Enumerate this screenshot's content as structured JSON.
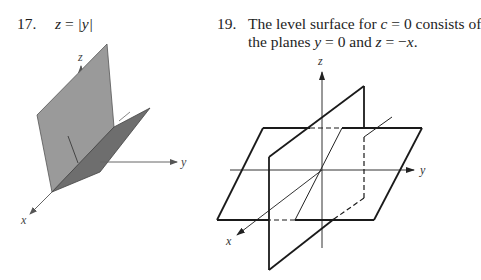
{
  "problems": [
    {
      "number": "17.",
      "equation": {
        "lhs": "z",
        "eq": " = ",
        "rhs": "|y|"
      },
      "figure": {
        "type": "3d-surface",
        "description": "V-shaped surface z = |y| shown as two shaded half-planes",
        "axes": {
          "x": "x",
          "y": "y",
          "z": "z"
        },
        "colors": {
          "left_plane": "#9a9a9a",
          "right_plane": "#6e6e6e",
          "axis": "#555555"
        }
      }
    },
    {
      "number": "19.",
      "text_line1_a": "The level surface for ",
      "text_line1_var": "c",
      "text_line1_b": " = 0 consists of",
      "text_line2_a": "the planes ",
      "text_line2_var1": "y",
      "text_line2_b": " = 0 and ",
      "text_line2_var2": "z",
      "text_line2_c": " = −",
      "text_line2_var3": "x",
      "text_line2_d": ".",
      "figure": {
        "type": "3d-planes",
        "description": "Two intersecting planes y = 0 and z = -x drawn as outlined parallelograms with hidden edges dashed",
        "axes": {
          "x": "x",
          "y": "y",
          "z": "z"
        },
        "colors": {
          "outline": "#1a1a1a",
          "axis": "#333333"
        }
      }
    }
  ]
}
